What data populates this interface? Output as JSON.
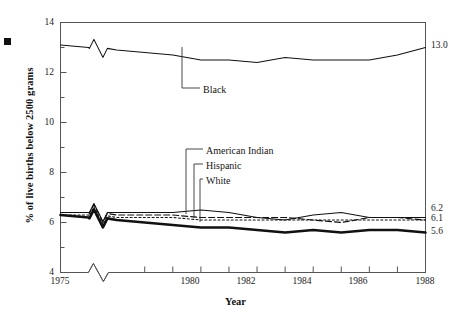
{
  "chart_data": {
    "type": "line",
    "title": "",
    "xlabel": "Year",
    "ylabel": "% of live births below 2500 grams",
    "xlim": [
      1975,
      1988
    ],
    "ylim": [
      4,
      14
    ],
    "yticks_major": [
      4,
      6,
      8,
      10,
      12,
      14
    ],
    "yticks_minor": [
      5,
      7,
      9,
      11,
      13
    ],
    "xticks_labeled": [
      1975,
      1980,
      1982,
      1984,
      1986,
      1988
    ],
    "xticks_all": [
      1975,
      1976,
      1977,
      1978,
      1979,
      1980,
      1981,
      1982,
      1983,
      1984,
      1985,
      1986,
      1987,
      1988
    ],
    "grid": false,
    "legend_position": "inline-leader-labels",
    "axis_break_x": true,
    "axis_break_note": "zigzag break between 1975 and 1977 on x-axis and on all series lines",
    "x": [
      1975,
      1976,
      1977,
      1978,
      1979,
      1980,
      1981,
      1982,
      1983,
      1984,
      1985,
      1986,
      1987,
      1988
    ],
    "series": [
      {
        "name": "Black",
        "style": "solid-thin",
        "end_value": "13.0",
        "values": [
          13.1,
          13.0,
          12.9,
          12.8,
          12.7,
          12.5,
          12.5,
          12.4,
          12.6,
          12.5,
          12.5,
          12.5,
          12.7,
          13.0
        ]
      },
      {
        "name": "American Indian",
        "style": "solid-thin",
        "end_value": "6.2",
        "values": [
          6.4,
          6.4,
          6.4,
          6.4,
          6.4,
          6.5,
          6.4,
          6.2,
          6.1,
          6.3,
          6.4,
          6.2,
          6.2,
          6.2
        ]
      },
      {
        "name": "Hispanic",
        "style": "dashed",
        "end_value": "6.1",
        "values": [
          6.4,
          6.4,
          6.3,
          6.3,
          6.3,
          6.2,
          6.2,
          6.2,
          6.2,
          6.1,
          6.0,
          6.2,
          6.2,
          6.1
        ]
      },
      {
        "name": "White",
        "style": "dotted",
        "end_value": "6.1",
        "values": [
          6.3,
          6.3,
          6.2,
          6.2,
          6.2,
          6.1,
          6.1,
          6.1,
          6.1,
          6.1,
          6.1,
          6.1,
          6.1,
          6.1
        ]
      },
      {
        "name": "Total/lower",
        "style": "solid-thick",
        "end_value": "5.6",
        "values": [
          6.3,
          6.2,
          6.1,
          6.0,
          5.9,
          5.8,
          5.8,
          5.7,
          5.6,
          5.7,
          5.6,
          5.7,
          5.7,
          5.6
        ]
      }
    ],
    "end_labels": [
      "13.0",
      "6.2",
      "6.1",
      "5.6"
    ],
    "series_labels": [
      "Black",
      "American Indian",
      "Hispanic",
      "White"
    ],
    "colors": {
      "axis": "#4a4a4a",
      "line": "#111111",
      "text": "#1a1a1a",
      "background": "#ffffff"
    }
  }
}
